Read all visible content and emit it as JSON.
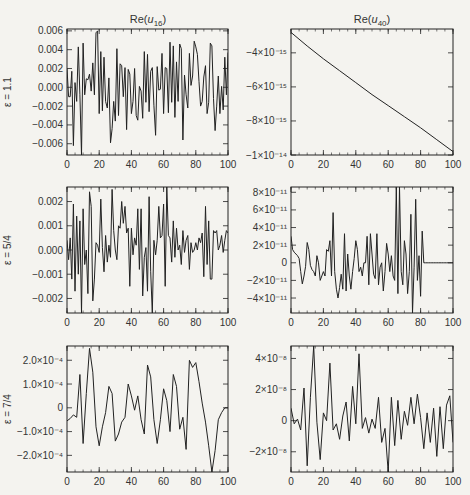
{
  "figure": {
    "column_titles": [
      "Re(u16)",
      "Re(u40)"
    ],
    "row_labels": [
      "ε = 1.1",
      "ε = 5/4",
      "ε = 7/4"
    ]
  },
  "chart_data": [
    {
      "type": "line",
      "panel": "row1-left",
      "title": "Re(u16)",
      "row_label": "ε = 1.1",
      "xlim": [
        0,
        100
      ],
      "ylim": [
        -0.0072,
        0.0062
      ],
      "xticks": [
        0,
        20,
        40,
        60,
        80,
        100
      ],
      "yticks": [
        -0.006,
        -0.004,
        -0.002,
        0.0,
        0.002,
        0.004,
        0.006
      ],
      "ytick_labels": [
        "−0.006",
        "−0.004",
        "−0.002",
        "0.000",
        "0.002",
        "0.004",
        "0.006"
      ],
      "x": [
        0,
        1,
        2,
        3,
        4,
        5,
        6,
        7,
        8,
        9,
        10,
        11,
        12,
        13,
        14,
        15,
        16,
        17,
        18,
        19,
        20,
        21,
        22,
        23,
        24,
        25,
        26,
        27,
        28,
        29,
        30,
        31,
        32,
        33,
        34,
        35,
        36,
        37,
        38,
        39,
        40,
        41,
        42,
        43,
        44,
        45,
        46,
        47,
        48,
        49,
        50,
        51,
        52,
        53,
        54,
        55,
        56,
        57,
        58,
        59,
        60,
        61,
        62,
        63,
        64,
        65,
        66,
        67,
        68,
        69,
        70,
        71,
        72,
        73,
        74,
        75,
        76,
        77,
        78,
        79,
        80,
        81,
        82,
        83,
        84,
        85,
        86,
        87,
        88,
        89,
        90,
        91,
        92,
        93,
        94,
        95,
        96,
        97,
        98,
        99,
        100
      ],
      "values": [
        0.002,
        -0.001,
        -0.001,
        0.0017,
        -0.0062,
        0.0005,
        -0.0015,
        0.0043,
        -0.0008,
        -0.0072,
        0.0047,
        -0.0008,
        0.0009,
        0.0008,
        0.0014,
        -0.0004,
        0.0026,
        -0.0008,
        0.0058,
        0.006,
        -0.0028,
        0.0038,
        -0.0025,
        0.0032,
        -0.0015,
        -0.0022,
        0.001,
        -0.0059,
        -0.0044,
        -0.0015,
        -0.0036,
        0.0041,
        -0.003,
        0.0025,
        0.0023,
        -0.001,
        0.0021,
        -0.0045,
        0.0019,
        0.0014,
        -0.0028,
        -0.0015,
        0.002,
        -0.003,
        -0.0035,
        0.0001,
        -0.0004,
        -0.0033,
        0.0038,
        -0.0016,
        0.0035,
        -0.0026,
        0.0017,
        0.0021,
        -0.0019,
        -0.0051,
        0.0022,
        -0.0003,
        -0.0002,
        0.0036,
        -0.0028,
        0.0021,
        0.002,
        -0.0027,
        0.0048,
        -0.0016,
        0.0044,
        -0.0032,
        0.0027,
        -0.0015,
        0.0046,
        0.0041,
        -0.0056,
        0.0013,
        -0.0008,
        -0.0022,
        0.0036,
        0.0002,
        0.0012,
        0.0049,
        0.0043,
        0.0035,
        0.0006,
        -0.002,
        -0.0015,
        0.0011,
        0.0023,
        -0.0028,
        -0.0016,
        0.0047,
        0.0044,
        -0.0012,
        -0.0046,
        -0.002,
        0.0012,
        -0.0028,
        0.0001,
        -0.0024,
        0.0032,
        -0.0008,
        0.0037
      ]
    },
    {
      "type": "line",
      "panel": "row1-right",
      "title": "Re(u40)",
      "xlim": [
        0,
        100
      ],
      "ylim": [
        -1e-14,
        -2.6e-15
      ],
      "xticks": [
        0,
        20,
        40,
        60,
        80,
        100
      ],
      "yticks": [
        -1e-14,
        -8e-15,
        -6e-15,
        -4e-15
      ],
      "ytick_labels": [
        "−1×10⁻¹⁴",
        "−8×10⁻¹⁵",
        "−6×10⁻¹⁵",
        "−4×10⁻¹⁵"
      ],
      "x": [
        0,
        10,
        20,
        30,
        40,
        50,
        60,
        70,
        80,
        90,
        100
      ],
      "values": [
        -2.8e-15,
        -3.6e-15,
        -4.35e-15,
        -5.05e-15,
        -5.75e-15,
        -6.45e-15,
        -7.1e-15,
        -7.75e-15,
        -8.4e-15,
        -9.1e-15,
        -9.8e-15
      ]
    },
    {
      "type": "line",
      "panel": "row2-left",
      "row_label": "ε = 5/4",
      "xlim": [
        0,
        100
      ],
      "ylim": [
        -0.0026,
        0.0026
      ],
      "xticks": [
        0,
        20,
        40,
        60,
        80,
        100
      ],
      "yticks": [
        -0.002,
        -0.001,
        0.0,
        0.001,
        0.002
      ],
      "ytick_labels": [
        "−0.002",
        "−0.001",
        "0.000",
        "0.001",
        "0.002"
      ],
      "x": [
        0,
        1,
        2,
        3,
        4,
        5,
        6,
        7,
        8,
        9,
        10,
        11,
        12,
        13,
        14,
        15,
        16,
        17,
        18,
        19,
        20,
        21,
        22,
        23,
        24,
        25,
        26,
        27,
        28,
        29,
        30,
        31,
        32,
        33,
        34,
        35,
        36,
        37,
        38,
        39,
        40,
        41,
        42,
        43,
        44,
        45,
        46,
        47,
        48,
        49,
        50,
        51,
        52,
        53,
        54,
        55,
        56,
        57,
        58,
        59,
        60,
        61,
        62,
        63,
        64,
        65,
        66,
        67,
        68,
        69,
        70,
        71,
        72,
        73,
        74,
        75,
        76,
        77,
        78,
        79,
        80,
        81,
        82,
        83,
        84,
        85,
        86,
        87,
        88,
        89,
        90,
        91,
        92,
        93,
        94,
        95,
        96,
        97,
        98,
        99,
        100
      ],
      "values": [
        0.0004,
        -0.0004,
        0.0005,
        -0.0012,
        0.0019,
        -0.0017,
        0.0014,
        -0.001,
        0.0012,
        -0.0026,
        0.0017,
        -0.0006,
        0.0,
        -0.0018,
        0.0024,
        0.0018,
        -0.0021,
        -0.0012,
        0.0003,
        0.0002,
        -0.0001,
        0.0021,
        0.0001,
        -0.0009,
        0.0006,
        -0.0005,
        0.0002,
        -0.0003,
        0.0025,
        0.0008,
        0.0,
        -0.0004,
        0.001,
        0.0009,
        0.002,
        0.0011,
        0.0018,
        0.0007,
        0.0009,
        -0.0015,
        0.0009,
        -0.0002,
        0.0005,
        0.0002,
        0.0017,
        -0.0008,
        0.0017,
        -0.0019,
        -0.0003,
        0.0001,
        -0.0017,
        0.0022,
        -0.0009,
        -0.0026,
        0.0004,
        -0.0002,
        0.0004,
        0.0018,
        0.0005,
        0.0006,
        0.0019,
        -0.0015,
        0.0026,
        0.0006,
        0.0005,
        -0.0005,
        0.0012,
        -0.0003,
        0.0009,
        0.0,
        0.0002,
        -0.0006,
        0.0008,
        -0.0001,
        0.0004,
        0.0006,
        -0.0008,
        0.0003,
        -0.0001,
        0.0,
        0.0003,
        0.0,
        0.0005,
        0.0003,
        0.0007,
        -0.0011,
        0.0018,
        -0.0006,
        0.0012,
        -0.0012,
        -0.0012,
        0.0008,
        0.0007,
        0.0008,
        0.0,
        0.0002,
        0.0006,
        -0.0001,
        0.0004,
        0.0008,
        0.0007
      ]
    },
    {
      "type": "line",
      "panel": "row2-right",
      "xlim": [
        0,
        100
      ],
      "ylim": [
        -5.7e-11,
        8.6e-11
      ],
      "xticks": [
        0,
        20,
        40,
        60,
        80,
        100
      ],
      "yticks": [
        -4e-11,
        -2e-11,
        0,
        2e-11,
        4e-11,
        6e-11,
        8e-11
      ],
      "ytick_labels": [
        "−4×10⁻¹¹",
        "−2×10⁻¹¹",
        "0",
        "2×10⁻¹¹",
        "4×10⁻¹¹",
        "6×10⁻¹¹",
        "8×10⁻¹¹"
      ],
      "x": [
        0,
        1,
        2,
        3,
        4,
        5,
        6,
        7,
        8,
        9,
        10,
        11,
        12,
        13,
        14,
        15,
        16,
        17,
        18,
        19,
        20,
        21,
        22,
        23,
        24,
        25,
        26,
        27,
        28,
        29,
        30,
        31,
        32,
        33,
        34,
        35,
        36,
        37,
        38,
        39,
        40,
        41,
        42,
        43,
        44,
        45,
        46,
        47,
        48,
        49,
        50,
        51,
        52,
        53,
        54,
        55,
        56,
        57,
        58,
        59,
        60,
        61,
        62,
        63,
        64,
        65,
        66,
        67,
        68,
        69,
        70,
        71,
        72,
        73,
        74,
        75,
        76,
        77,
        78,
        79,
        80,
        81,
        82,
        83,
        84,
        85,
        86,
        87,
        88,
        89,
        90,
        91,
        92,
        93,
        94,
        95,
        96,
        97,
        98,
        99,
        100
      ],
      "values": [
        3e-11,
        1.5e-11,
        1.2e-11,
        1e-11,
        8e-12,
        5e-12,
        -1e-11,
        -2.4e-11,
        -1.5e-11,
        -4e-12,
        2.3e-11,
        1.5e-11,
        -3e-12,
        -8e-12,
        -1e-11,
        -1.5e-11,
        8e-12,
        0,
        -2e-11,
        -1.5e-11,
        -1e-11,
        -1.5e-11,
        1.5e-11,
        1.3e-11,
        2.5e-11,
        -1.5e-11,
        5.7e-11,
        -1e-11,
        -3e-11,
        -4e-11,
        -2.8e-11,
        -1.3e-11,
        -3e-11,
        3.3e-11,
        -3.2e-11,
        1e-11,
        -1.5e-11,
        -3e-11,
        -1e-11,
        5e-12,
        2.5e-11,
        1.5e-11,
        -1e-11,
        -5e-12,
        -1.5e-11,
        0,
        0,
        3e-11,
        -2.5e-11,
        3.3e-11,
        1e-11,
        -1.3e-11,
        -1.8e-11,
        3.3e-11,
        -2.5e-11,
        -5e-12,
        0,
        -3.2e-11,
        -1e-11,
        2.2e-11,
        1e-11,
        -1e-11,
        8e-12,
        -1.5e-11,
        -2e-11,
        8.6e-11,
        -3.5e-11,
        8.6e-11,
        -1e-11,
        -2.5e-11,
        2.5e-11,
        1e-11,
        -3.5e-11,
        -1e-11,
        5.5e-11,
        -5.7e-11,
        -5e-12,
        7.2e-11,
        -2e-11,
        8e-12,
        -3.8e-11,
        3.6e-11,
        0,
        0,
        0,
        0,
        0,
        0,
        0,
        0,
        0,
        0,
        0,
        0,
        0,
        0,
        0,
        0,
        0,
        0,
        0
      ]
    },
    {
      "type": "line",
      "panel": "row3-left",
      "row_label": "ε = 7/4",
      "xlim": [
        0,
        100
      ],
      "ylim": [
        -0.00027,
        0.00026
      ],
      "xticks": [
        0,
        20,
        40,
        60,
        80,
        100
      ],
      "yticks": [
        -0.0002,
        -0.0001,
        0,
        0.0001,
        0.0002
      ],
      "ytick_labels": [
        "−2.0×10⁻⁴",
        "−1.0×10⁻⁴",
        "0",
        "1.0×10⁻⁴",
        "2.0×10⁻⁴"
      ],
      "x": [
        0,
        2,
        4,
        6,
        8,
        10,
        12,
        14,
        16,
        18,
        20,
        22,
        24,
        26,
        28,
        30,
        32,
        34,
        36,
        38,
        40,
        42,
        44,
        46,
        48,
        50,
        52,
        54,
        56,
        58,
        60,
        62,
        64,
        66,
        68,
        70,
        72,
        74,
        76,
        78,
        80,
        82,
        84,
        86,
        88,
        90,
        92,
        94,
        96,
        98,
        100
      ],
      "values": [
        -5.5e-05,
        -4.5e-05,
        -3e-05,
        -4e-05,
        0.00014,
        -0.00015,
        6e-05,
        0.00025,
        0.00015,
        -8e-05,
        -0.00016,
        -8e-05,
        -2e-05,
        9e-05,
        6e-05,
        -0.00014,
        -0.00011,
        -6e-05,
        -4e-05,
        0.0001,
        5e-05,
        -1e-05,
        5e-05,
        -5e-05,
        -0.00011,
        0.00018,
        0.00013,
        -5e-05,
        -0.00015,
        -5e-05,
        8e-05,
        3e-05,
        -0.0001,
        0.00014,
        9e-05,
        -9e-05,
        -4e-05,
        -0.000175,
        0.0002,
        0.00017,
        0.00019,
        0.00011,
        2e-05,
        -6e-05,
        -0.00016,
        -0.00027,
        -0.00018,
        -5e-05,
        -2e-05,
        0,
        0
      ]
    },
    {
      "type": "line",
      "panel": "row3-right",
      "xlim": [
        0,
        100
      ],
      "ylim": [
        -3.3e-08,
        4.8e-08
      ],
      "xticks": [
        0,
        20,
        40,
        60,
        80,
        100
      ],
      "yticks": [
        -2e-08,
        0,
        2e-08,
        4e-08
      ],
      "ytick_labels": [
        "−2×10⁻⁸",
        "0",
        "2×10⁻⁸",
        "4×10⁻⁸"
      ],
      "x": [
        0,
        2,
        4,
        6,
        8,
        10,
        12,
        14,
        16,
        18,
        20,
        22,
        24,
        26,
        28,
        30,
        32,
        34,
        36,
        38,
        40,
        42,
        44,
        46,
        48,
        50,
        52,
        54,
        56,
        58,
        60,
        62,
        64,
        66,
        68,
        70,
        72,
        74,
        76,
        78,
        80,
        82,
        84,
        86,
        88,
        90,
        92,
        94,
        96,
        98,
        100
      ],
      "values": [
        8e-09,
        -2e-09,
        1e-09,
        -6e-09,
        2.1e-08,
        -2.9e-08,
        1.5e-08,
        4.8e-08,
        -1e-09,
        -2.5e-08,
        5e-09,
        0,
        3.7e-08,
        -6e-09,
        -2e-09,
        -1.2e-08,
        3e-09,
        1.2e-08,
        -1.3e-08,
        2.2e-08,
        -2e-09,
        4.3e-08,
        -5e-09,
        2e-09,
        -8e-09,
        1e-09,
        -5e-09,
        1.5e-08,
        -1.4e-08,
        -5e-09,
        -3.3e-08,
        1.5e-08,
        -1.6e-08,
        1.3e-08,
        -1.2e-08,
        6e-09,
        -3e-09,
        1.5e-08,
        -2e-09,
        1.7e-08,
        2e-09,
        -1.8e-08,
        5e-09,
        -1.4e-08,
        8e-09,
        -2.3e-08,
        9e-09,
        -1.8e-08,
        1e-08,
        1.6e-08,
        -1.4e-08
      ]
    }
  ]
}
